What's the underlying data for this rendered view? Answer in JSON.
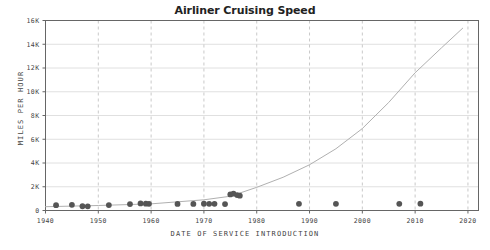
{
  "chart_data": {
    "type": "scatter",
    "title": "Airliner Cruising Speed",
    "xlabel": "DATE OF SERVICE INTRODUCTION",
    "ylabel": "MILES PER HOUR",
    "xlim": [
      1940,
      2022
    ],
    "ylim": [
      0,
      16000
    ],
    "grid": true,
    "legend": null,
    "xticks": [
      1940,
      1950,
      1960,
      1970,
      1980,
      1990,
      2000,
      2010,
      2020
    ],
    "xtick_labels": [
      "1940",
      "1950",
      "1960",
      "1970",
      "1980",
      "1990",
      "2000",
      "2010",
      "2020"
    ],
    "yticks": [
      0,
      2000,
      4000,
      6000,
      8000,
      10000,
      12000,
      14000,
      16000
    ],
    "ytick_labels": [
      "0",
      "2K",
      "4K",
      "6K",
      "8K",
      "10K",
      "12K",
      "14K",
      "16K"
    ],
    "marker_color": "#555555",
    "curve_color": "#b0b0b0",
    "grid_color": "#d8d8d8",
    "vgrid_color": "#bbbbbb",
    "axis_color": "#666666",
    "series": [
      {
        "name": "Airliners",
        "type": "scatter",
        "points": [
          {
            "x": 1942,
            "y": 450
          },
          {
            "x": 1945,
            "y": 480
          },
          {
            "x": 1947,
            "y": 360
          },
          {
            "x": 1948,
            "y": 350
          },
          {
            "x": 1952,
            "y": 460
          },
          {
            "x": 1956,
            "y": 540
          },
          {
            "x": 1958,
            "y": 600
          },
          {
            "x": 1959,
            "y": 575
          },
          {
            "x": 1959.6,
            "y": 560
          },
          {
            "x": 1965,
            "y": 550
          },
          {
            "x": 1968,
            "y": 550
          },
          {
            "x": 1970,
            "y": 570
          },
          {
            "x": 1971,
            "y": 560
          },
          {
            "x": 1972,
            "y": 565
          },
          {
            "x": 1974,
            "y": 545
          },
          {
            "x": 1975,
            "y": 1350
          },
          {
            "x": 1975.6,
            "y": 1420
          },
          {
            "x": 1976.3,
            "y": 1300
          },
          {
            "x": 1976.8,
            "y": 1250
          },
          {
            "x": 1988,
            "y": 560
          },
          {
            "x": 1995,
            "y": 560
          },
          {
            "x": 2007,
            "y": 560
          },
          {
            "x": 2011,
            "y": 575
          }
        ]
      },
      {
        "name": "Exponential trend",
        "type": "line",
        "points": [
          {
            "x": 1940,
            "y": 320
          },
          {
            "x": 1950,
            "y": 420
          },
          {
            "x": 1960,
            "y": 560
          },
          {
            "x": 1970,
            "y": 900
          },
          {
            "x": 1975,
            "y": 1200
          },
          {
            "x": 1980,
            "y": 1950
          },
          {
            "x": 1985,
            "y": 2800
          },
          {
            "x": 1990,
            "y": 3850
          },
          {
            "x": 1995,
            "y": 5200
          },
          {
            "x": 2000,
            "y": 6900
          },
          {
            "x": 2005,
            "y": 9100
          },
          {
            "x": 2010,
            "y": 11600
          },
          {
            "x": 2015,
            "y": 13700
          },
          {
            "x": 2019,
            "y": 15350
          }
        ]
      }
    ]
  }
}
